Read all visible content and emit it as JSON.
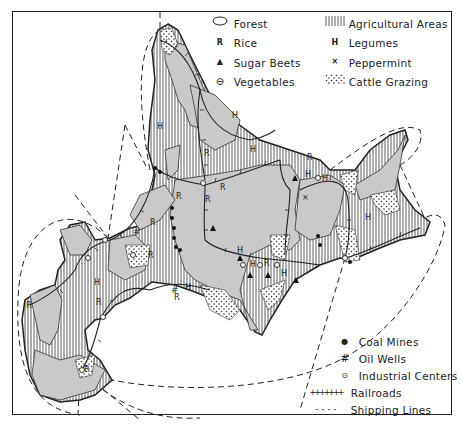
{
  "map": {
    "subject": "Hokkaido economic map",
    "colors": {
      "ink": "#222222",
      "land_fill": "#c9c9c9",
      "paper": "#ffffff"
    }
  },
  "legend_top": {
    "left": [
      {
        "symbol": "oval",
        "label": "Forest"
      },
      {
        "symbol": "R",
        "label": "Rice"
      },
      {
        "symbol": "▲",
        "label": "Sugar Beets"
      },
      {
        "symbol": "⊖",
        "label": "Vegetables"
      }
    ],
    "right": [
      {
        "symbol": "vertical-hatch",
        "label": "Agricultural Areas"
      },
      {
        "symbol": "H",
        "label": "Legumes"
      },
      {
        "symbol": "×",
        "label": "Peppermint"
      },
      {
        "symbol": "dots",
        "label": "Cattle Grazing"
      }
    ]
  },
  "legend_bottom": [
    {
      "symbol": "●",
      "label": "Coal Mines"
    },
    {
      "symbol": "#",
      "label": "Oil Wells"
    },
    {
      "symbol": "⊙",
      "label": "Industrial Centers"
    },
    {
      "symbol": "+++++++",
      "label": "Railroads"
    },
    {
      "symbol": "- - - -",
      "label": "Shipping Lines"
    }
  ],
  "map_labels": {
    "R": "R",
    "H": "H"
  }
}
